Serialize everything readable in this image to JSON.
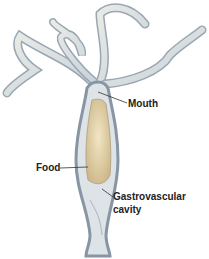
{
  "diagram": {
    "labels": {
      "mouth": "Mouth",
      "food": "Food",
      "cavity_line1": "Gastrovascular",
      "cavity_line2": "cavity"
    },
    "colors": {
      "body_outline": "#8a98a8",
      "body_fill": "#d8dfe4",
      "food": "#e6d7b0",
      "leader_line": "#333333"
    }
  }
}
